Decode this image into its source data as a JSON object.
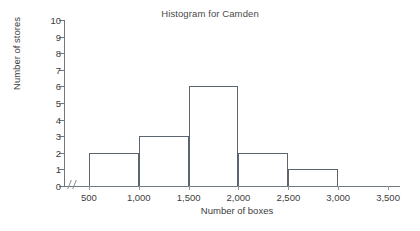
{
  "chart_data": {
    "type": "bar",
    "title": "Histogram for Camden",
    "xlabel": "Number of boxes",
    "ylabel": "Number of stores",
    "categories": [
      "500-1,000",
      "1,000-1,500",
      "1,500-2,000",
      "2,000-2,500",
      "2,500-3,000"
    ],
    "bin_edges": [
      500,
      1000,
      1500,
      2000,
      2500,
      3000
    ],
    "values": [
      2,
      3,
      6,
      2,
      1
    ],
    "ylim": [
      0,
      10
    ],
    "xlim": [
      500,
      3500
    ],
    "ytick_labels": [
      "10",
      "9",
      "8",
      "7",
      "6",
      "5",
      "4",
      "3",
      "2",
      "1",
      "0"
    ],
    "ytick_values": [
      10,
      9,
      8,
      7,
      6,
      5,
      4,
      3,
      2,
      1,
      0
    ],
    "xtick_labels": [
      "500",
      "1,000",
      "1,500",
      "2,000",
      "2,500",
      "3,000",
      "3,500"
    ],
    "xtick_values": [
      500,
      1000,
      1500,
      2000,
      2500,
      3000,
      3500
    ],
    "grid": false,
    "legend": false,
    "axis_break": true,
    "bar_fill": "#ffffff",
    "bar_stroke": "#5a6570",
    "axis_color": "#6e7880",
    "text_color": "#3d3d3d"
  }
}
